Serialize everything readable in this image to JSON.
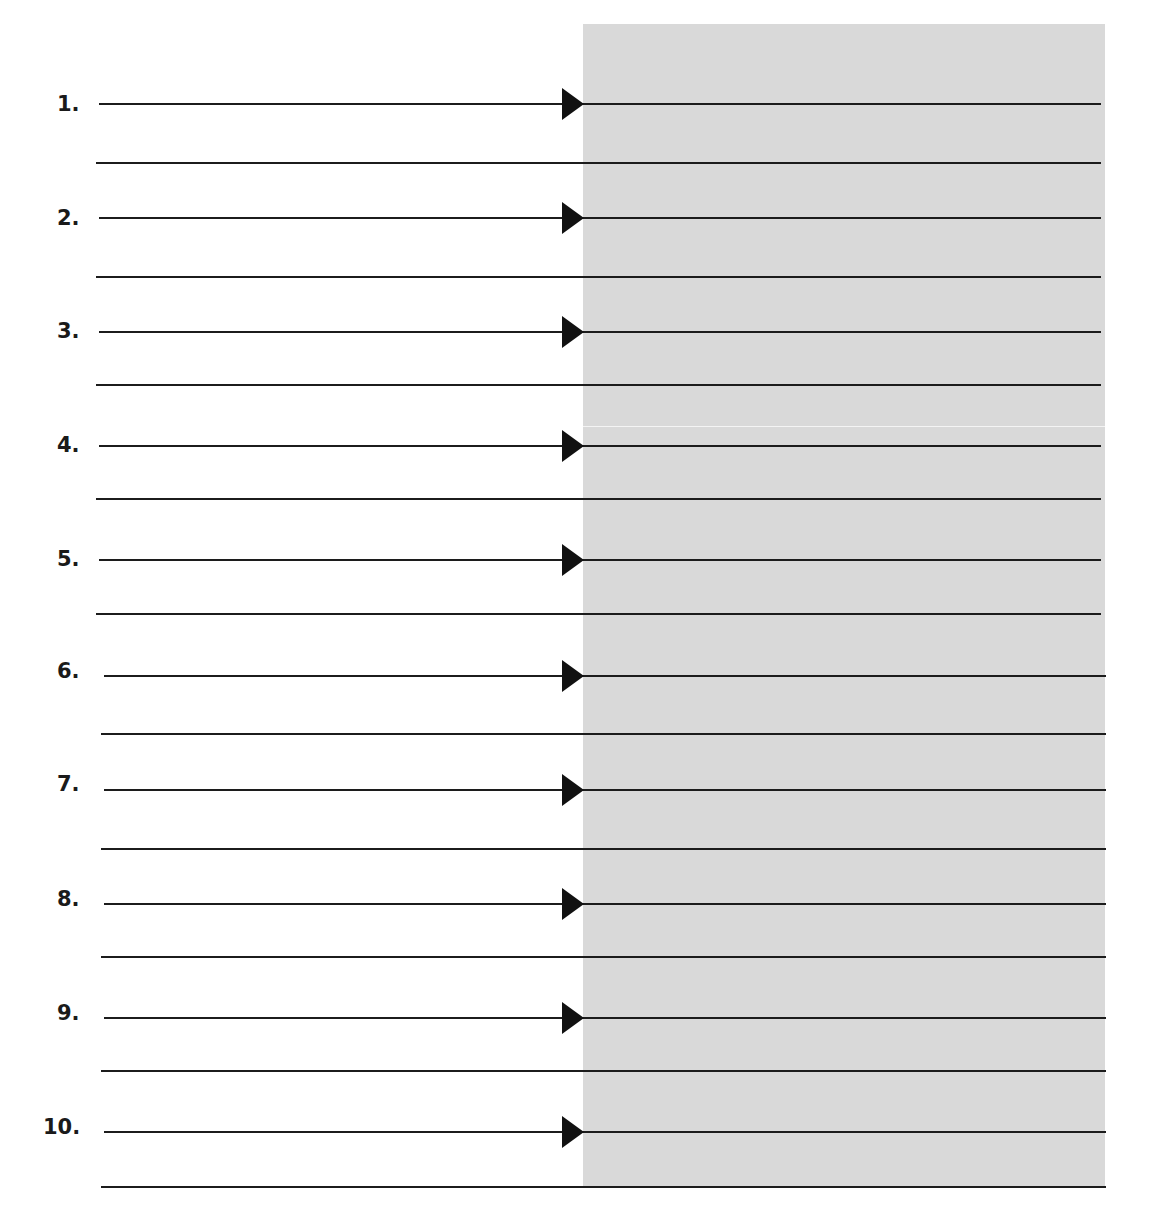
{
  "worksheet": {
    "header_fragment": "",
    "shade_color": "#d9d9d9",
    "line_color": "#1c1c1c",
    "rows": [
      {
        "label": "1."
      },
      {
        "label": "2."
      },
      {
        "label": "3."
      },
      {
        "label": "4."
      },
      {
        "label": "5."
      },
      {
        "label": "6."
      },
      {
        "label": "7."
      },
      {
        "label": "8."
      },
      {
        "label": "9."
      },
      {
        "label": "10."
      }
    ]
  }
}
